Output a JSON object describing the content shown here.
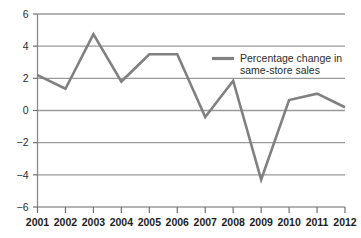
{
  "chart_data": {
    "type": "line",
    "title": "",
    "xlabel": "",
    "ylabel": "",
    "categories": [
      "2001",
      "2002",
      "2003",
      "2004",
      "2005",
      "2006",
      "2007",
      "2008",
      "2009",
      "2010",
      "2011",
      "2012"
    ],
    "x": [
      2001,
      2002,
      2003,
      2004,
      2005,
      2006,
      2007,
      2008,
      2009,
      2010,
      2011,
      2012
    ],
    "series": [
      {
        "name": "Percentage change in same-store sales",
        "values": [
          2.2,
          1.35,
          4.75,
          1.8,
          3.5,
          3.5,
          -0.4,
          1.85,
          -4.3,
          0.65,
          1.05,
          0.2
        ],
        "color": "#808080"
      }
    ],
    "ylim": [
      -6,
      6
    ],
    "yticks": [
      6,
      4,
      2,
      0,
      -2,
      -4,
      -6
    ],
    "ytick_labels": [
      "6",
      "4",
      "2",
      "0",
      "−2",
      "−4",
      "−6"
    ],
    "xtick_labels": [
      "2001",
      "2002",
      "2003",
      "2004",
      "2005",
      "2006",
      "2007",
      "2008",
      "2009",
      "2010",
      "2011",
      "2012"
    ],
    "grid": true,
    "grid_color": "#9a9a9a",
    "legend_position": "upper right",
    "legend": [
      {
        "label_line1": "Percentage change in",
        "label_line2": "same-store sales",
        "color": "#808080"
      }
    ]
  }
}
